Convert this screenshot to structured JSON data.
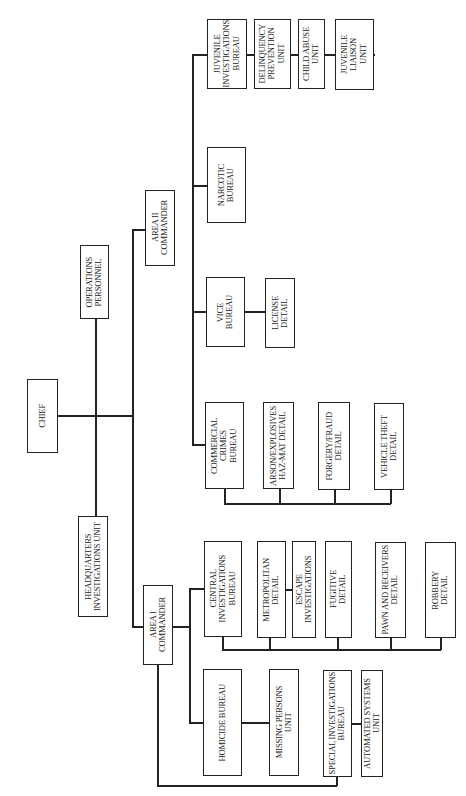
{
  "chart": {
    "title": "",
    "orientation": "rotated-90-ccw",
    "nodes": {
      "chief": "CHIEF",
      "operations_personnel": "OPERATIONS\nPERSONNEL",
      "hq_investigations_unit": "HEADQUARTERS\nINVESTIGATIONS UNIT",
      "area2_commander": "AREA II\nCOMMANDER",
      "area1_commander": "AREA I\nCOMMANDER",
      "juvenile_investigations_bureau": "JUVENILE\nINVESTIGATIONS\nBUREAU",
      "delinquency_prevention_unit": "DELINQUENCY\nPREVENTION\nUNIT",
      "child_abuse_unit": "CHILD ABUSE\nUNIT",
      "juvenile_liaison_unit": "JUVENILE\nLIAISON\nUNIT",
      "narcotic_bureau": "NARCOTIC\nBUREAU",
      "vice_bureau": "VICE\nBUREAU",
      "license_detail": "LICENSE\nDETAIL",
      "commercial_crimes_bureau": "COMMERCIAL CRIMES\nBUREAU",
      "arson_explosives_detail": "ARSON/EXPLOSIVES\nHAZ-MAT DETAIL",
      "forgery_fraud_detail": "FORGERY/FRAUD\nDETAIL",
      "vehicle_theft_detail": "VEHICLE THEFT\nDETAIL",
      "central_investigations_bureau": "CENTRAL\nINVESTIGATIONS\nBUREAU",
      "metropolitan_detail": "METROPOLITAN\nDETAIL",
      "escape_investigations": "ESCAPE INVESTIGATIONS",
      "fugitive_detail": "FUGITIVE\nDETAIL",
      "pawn_receivers_detail": "PAWN AND RECEIVERS\nDETAIL",
      "robbery_detail": "ROBBERY\nDETAIL",
      "homicide_bureau": "HOMICIDE BUREAU",
      "missing_persons_unit": "MISSING PERSONS\nUNIT",
      "special_investigations_bureau": "SPECIAL INVESTIGATIONS\nBUREAU",
      "automated_systems_unit": "AUTOMATED SYSTEMS UNIT"
    },
    "hierarchy": [
      {
        "parent": "chief",
        "children": [
          "operations_personnel",
          "hq_investigations_unit",
          "area2_commander",
          "area1_commander"
        ]
      },
      {
        "parent": "area2_commander",
        "children": [
          "juvenile_investigations_bureau",
          "narcotic_bureau",
          "vice_bureau",
          "commercial_crimes_bureau"
        ]
      },
      {
        "parent": "juvenile_investigations_bureau",
        "children": [
          "delinquency_prevention_unit",
          "child_abuse_unit",
          "juvenile_liaison_unit"
        ]
      },
      {
        "parent": "vice_bureau",
        "children": [
          "license_detail"
        ]
      },
      {
        "parent": "commercial_crimes_bureau",
        "children": [
          "arson_explosives_detail",
          "forgery_fraud_detail",
          "vehicle_theft_detail"
        ]
      },
      {
        "parent": "area1_commander",
        "children": [
          "central_investigations_bureau",
          "homicide_bureau",
          "special_investigations_bureau"
        ]
      },
      {
        "parent": "central_investigations_bureau",
        "children": [
          "metropolitan_detail",
          "fugitive_detail",
          "pawn_receivers_detail",
          "robbery_detail"
        ]
      },
      {
        "parent": "metropolitan_detail",
        "children": [
          "escape_investigations"
        ]
      },
      {
        "parent": "homicide_bureau",
        "children": [
          "missing_persons_unit"
        ]
      },
      {
        "parent": "special_investigations_bureau",
        "children": [
          "automated_systems_unit"
        ]
      }
    ]
  }
}
